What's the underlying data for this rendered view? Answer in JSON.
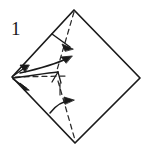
{
  "figure": {
    "kind": "origami-fold-diagram",
    "step_number": "1",
    "background_color": "#ffffff",
    "ink_color": "#1a1a1a",
    "canvas": {
      "width": 147,
      "height": 150
    }
  },
  "shape": {
    "name": "square-rotated-45-diamond",
    "vertices": {
      "top": {
        "x": 74,
        "y": 10
      },
      "right": {
        "x": 140,
        "y": 78
      },
      "bottom": {
        "x": 75,
        "y": 143
      },
      "left": {
        "x": 12,
        "y": 77
      }
    },
    "outline_points": "74,10 140,78 75,143 12,77",
    "stroke_width": 1.6,
    "fill": "#ffffff"
  },
  "fold_lines": [
    {
      "name": "upper-valley-fold",
      "style": "dashed",
      "from": {
        "x": 74,
        "y": 11
      },
      "to": {
        "x": 57,
        "y": 71
      },
      "dash_pattern": "5,4"
    },
    {
      "name": "horizontal-valley-fold",
      "style": "dashed",
      "from": {
        "x": 14,
        "y": 77
      },
      "to": {
        "x": 67,
        "y": 76
      },
      "dash_pattern": "5,4"
    },
    {
      "name": "lower-valley-fold",
      "style": "dashed",
      "from": {
        "x": 58,
        "y": 80
      },
      "to": {
        "x": 75,
        "y": 141
      },
      "dash_pattern": "5,4"
    }
  ],
  "creases": [
    {
      "name": "center-curved-crease",
      "path": "M 13,78 C 30,76 46,73 58,72"
    },
    {
      "name": "y-junction-left-branch",
      "path": "M 58,72 L 52,82"
    },
    {
      "name": "y-junction-right-branch",
      "path": "M 58,72 L 61,84"
    },
    {
      "name": "y-junction-stem",
      "path": "M 60,84 L 60,95"
    }
  ],
  "arrows": [
    {
      "name": "upper-fold-arrow",
      "description": "short arrow crossing upper dashed fold, pointing right",
      "shaft": "M 52,34 L 72,48",
      "head_points": "72,48 63,45 65,50"
    },
    {
      "name": "center-fold-arrow",
      "description": "curved arrow from left vertex to upper right",
      "shaft": "M 20,73 C 38,68 54,64 70,58",
      "head_points": "72,57 62,57 67,63"
    },
    {
      "name": "lower-fold-arrow",
      "description": "curved arrow near lower dashed fold, pointing up-right",
      "shaft": "M 50,113 C 58,104 64,101 72,101",
      "head_points": "74,100 65,98 66,104"
    },
    {
      "name": "left-vertex-arrow-up",
      "description": "small arrowhead near left vertex pointing up-right",
      "shaft": "M 13,76 L 28,66",
      "head_points": "29,65 21,65 25,71"
    },
    {
      "name": "left-vertex-arrow-down",
      "description": "small arrowhead near left vertex pointing down-right",
      "shaft": "M 13,79 L 28,89",
      "head_points": "29,90 21,84 25,90"
    }
  ]
}
